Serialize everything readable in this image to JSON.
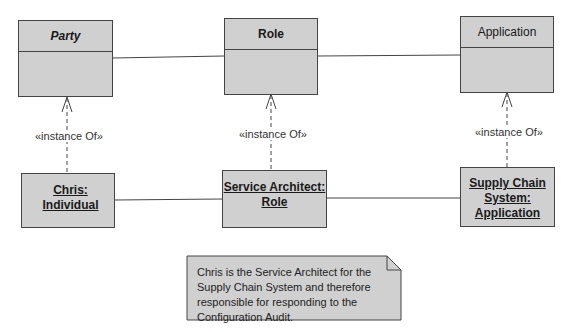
{
  "classes": [
    {
      "id": "party",
      "name": "Party",
      "style": "italic"
    },
    {
      "id": "role",
      "name": "Role",
      "style": "bold"
    },
    {
      "id": "application",
      "name": "Application",
      "style": "normal"
    }
  ],
  "instances": [
    {
      "id": "chris",
      "lines": [
        "Chris: Individual"
      ]
    },
    {
      "id": "service-architect",
      "lines": [
        "Service Architect:",
        "Role"
      ]
    },
    {
      "id": "supply-chain",
      "lines": [
        "Supply Chain",
        "System:",
        "Application"
      ]
    }
  ],
  "dependency_label": "«instance Of»",
  "note": {
    "text": "Chris is the Service Architect for the Supply Chain System and therefore responsible for responding to the Configuration Audit."
  },
  "colors": {
    "fill": "#d0d0d0",
    "stroke": "#444444"
  }
}
